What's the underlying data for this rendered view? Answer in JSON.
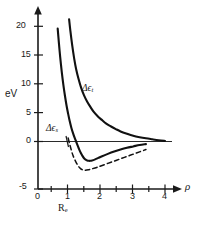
{
  "figure": {
    "background_color": "#ffffff",
    "ink_color": "#111111"
  },
  "chart_data": {
    "type": "line",
    "title": "",
    "subtitle": "",
    "xlabel": "ρ",
    "ylabel": "eV",
    "xlim": [
      0,
      4.6
    ],
    "ylim": [
      -5,
      21.5
    ],
    "grid": false,
    "legend_position": "inline-annotations",
    "x_ticks_major": [
      0,
      1,
      2,
      3,
      4
    ],
    "x_tick_labels": [
      "0",
      "1",
      "2",
      "3",
      "4"
    ],
    "x_ticks_minor": [
      0.5,
      1.5,
      2.5,
      3.5
    ],
    "y_ticks": [
      -5,
      0,
      5,
      10,
      15,
      20
    ],
    "y_tick_labels": [
      "-5",
      "0",
      "5",
      "10",
      "15",
      "20"
    ],
    "annotations": [
      {
        "name": "delta-epsilon-t",
        "text_base": "Δϵ",
        "text_sub": "t",
        "x_px": 82,
        "y_px": 88,
        "describes": "upper repulsive triplet curve"
      },
      {
        "name": "delta-epsilon-s",
        "text_base": "Δϵ",
        "text_sub": "s",
        "x_px": 47,
        "y_px": 128,
        "describes": "lower binding singlet curve"
      },
      {
        "name": "equilibrium-distance",
        "text_base": "R",
        "text_sub": "e",
        "x_px": 59,
        "y_px": 203,
        "describes": "equilibrium separation marker below rho = 1"
      }
    ],
    "series": [
      {
        "name": "Δϵ_s",
        "style": "solid",
        "label": "Δϵs",
        "points": [
          [
            0.62,
            19.6
          ],
          [
            0.66,
            17.0
          ],
          [
            0.7,
            14.6
          ],
          [
            0.75,
            12.0
          ],
          [
            0.8,
            9.8
          ],
          [
            0.85,
            7.9
          ],
          [
            0.9,
            6.2
          ],
          [
            0.95,
            4.8
          ],
          [
            1.0,
            3.5
          ],
          [
            1.05,
            2.4
          ],
          [
            1.1,
            1.5
          ],
          [
            1.15,
            0.7
          ],
          [
            1.2,
            0.0
          ],
          [
            1.25,
            -0.7
          ],
          [
            1.3,
            -1.4
          ],
          [
            1.35,
            -2.0
          ],
          [
            1.4,
            -2.5
          ],
          [
            1.45,
            -2.9
          ],
          [
            1.5,
            -3.15
          ],
          [
            1.55,
            -3.3
          ],
          [
            1.6,
            -3.35
          ],
          [
            1.65,
            -3.35
          ],
          [
            1.7,
            -3.3
          ],
          [
            1.8,
            -3.1
          ],
          [
            1.9,
            -2.85
          ],
          [
            2.0,
            -2.6
          ],
          [
            2.2,
            -2.15
          ],
          [
            2.4,
            -1.75
          ],
          [
            2.6,
            -1.4
          ],
          [
            2.8,
            -1.1
          ],
          [
            3.0,
            -0.85
          ],
          [
            3.2,
            -0.6
          ],
          [
            3.4,
            -0.45
          ]
        ]
      },
      {
        "name": "Δϵ_t",
        "style": "solid",
        "label": "Δϵt",
        "points": [
          [
            0.98,
            21.2
          ],
          [
            1.02,
            19.2
          ],
          [
            1.08,
            16.6
          ],
          [
            1.14,
            14.4
          ],
          [
            1.2,
            12.6
          ],
          [
            1.28,
            10.8
          ],
          [
            1.36,
            9.3
          ],
          [
            1.45,
            8.0
          ],
          [
            1.55,
            6.9
          ],
          [
            1.65,
            6.0
          ],
          [
            1.75,
            5.2
          ],
          [
            1.88,
            4.4
          ],
          [
            2.0,
            3.8
          ],
          [
            2.15,
            3.1
          ],
          [
            2.3,
            2.6
          ],
          [
            2.45,
            2.15
          ],
          [
            2.6,
            1.75
          ],
          [
            2.8,
            1.35
          ],
          [
            3.0,
            1.0
          ],
          [
            3.2,
            0.75
          ],
          [
            3.4,
            0.55
          ],
          [
            3.6,
            0.38
          ],
          [
            3.8,
            0.22
          ],
          [
            4.0,
            0.1
          ]
        ]
      },
      {
        "name": "dashed-reference",
        "style": "dashed",
        "label": "",
        "points": [
          [
            0.95,
            0.6
          ],
          [
            1.0,
            -0.5
          ],
          [
            1.05,
            -1.5
          ],
          [
            1.1,
            -2.4
          ],
          [
            1.18,
            -3.4
          ],
          [
            1.26,
            -4.2
          ],
          [
            1.34,
            -4.7
          ],
          [
            1.42,
            -4.95
          ],
          [
            1.5,
            -5.0
          ],
          [
            1.6,
            -4.9
          ],
          [
            1.7,
            -4.75
          ],
          [
            1.85,
            -4.5
          ],
          [
            2.0,
            -4.2
          ],
          [
            2.2,
            -3.8
          ],
          [
            2.4,
            -3.4
          ],
          [
            2.6,
            -3.0
          ],
          [
            2.8,
            -2.6
          ],
          [
            3.0,
            -2.2
          ],
          [
            3.2,
            -1.8
          ],
          [
            3.4,
            -1.4
          ]
        ]
      }
    ]
  },
  "labels": {
    "y_axis_title": "eV",
    "x_axis_title": "ρ",
    "y_ticks": [
      "20",
      "15",
      "10",
      "5",
      "0"
    ],
    "origin_label": "0",
    "minus_five_label": "-5",
    "x_ticks": [
      "1",
      "2",
      "3",
      "4"
    ]
  }
}
